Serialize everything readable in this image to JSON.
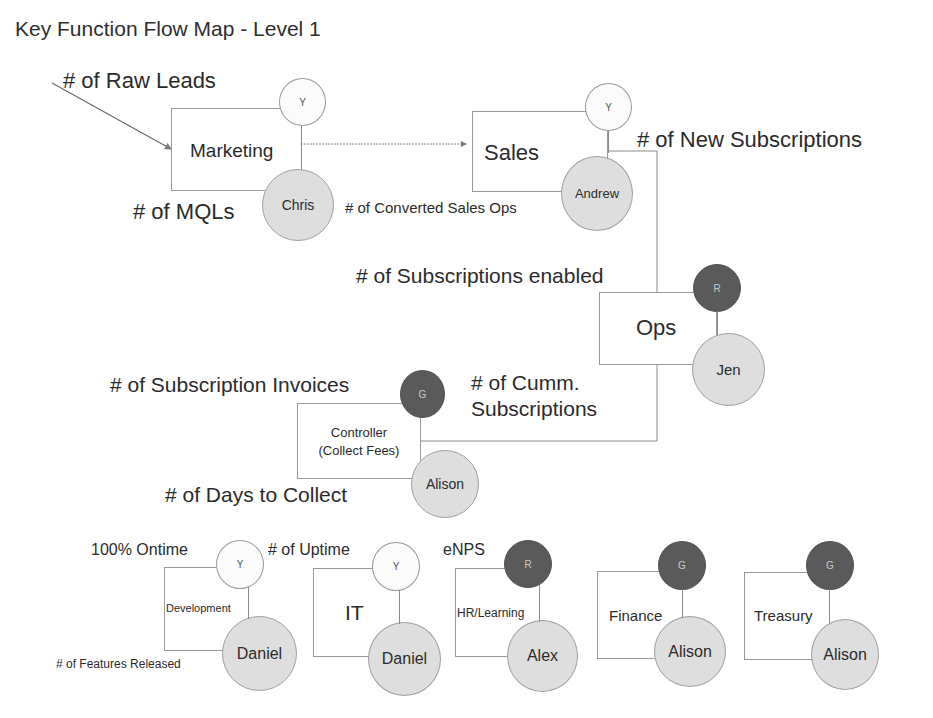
{
  "title": "Key Function Flow Map - Level 1",
  "colors": {
    "line": "#8a8a8a",
    "person_fill": "#dedede",
    "status_dark_fill": "#5a5a5a",
    "status_light_fill": "#fbfbfb",
    "text": "#2b2b2b"
  },
  "functions": {
    "marketing": {
      "label": "Marketing",
      "owner": "Chris",
      "status": "Y",
      "metrics": {
        "input": "# of Raw Leads",
        "output": "# of  MQLs"
      }
    },
    "sales": {
      "label": "Sales",
      "owner": "Andrew",
      "status": "Y",
      "metrics": {
        "input": "# of  Converted Sales Ops",
        "output": "# of New Subscriptions"
      }
    },
    "ops": {
      "label": "Ops",
      "owner": "Jen",
      "status": "R",
      "metrics": {
        "input": "# of Subscriptions enabled",
        "output_line1": "# of Cumm.",
        "output_line2": "Subscriptions"
      }
    },
    "controller": {
      "label_line1": "Controller",
      "label_line2": "(Collect Fees)",
      "owner": "Alison",
      "status": "G",
      "metrics": {
        "input": "# of Subscription Invoices",
        "output": "# of Days to Collect"
      }
    },
    "development": {
      "label": "Development",
      "owner": "Daniel",
      "status": "Y",
      "metrics": {
        "top": "100% Ontime",
        "bottom": "# of Features Released"
      }
    },
    "it": {
      "label": "IT",
      "owner": "Daniel",
      "status": "Y",
      "metrics": {
        "top": "# of Uptime"
      }
    },
    "hr": {
      "label": "HR/Learning",
      "owner": "Alex",
      "status": "R",
      "metrics": {
        "top": "eNPS"
      }
    },
    "finance": {
      "label": "Finance",
      "owner": "Alison",
      "status": "G"
    },
    "treasury": {
      "label": "Treasury",
      "owner": "Alison",
      "status": "G"
    }
  }
}
